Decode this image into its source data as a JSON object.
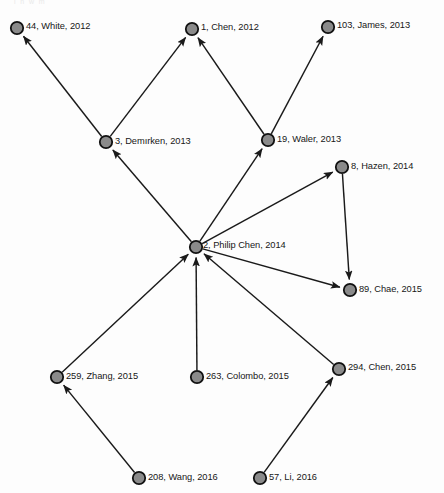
{
  "figure": {
    "type": "citation-network-graph",
    "top_artifact_text": "l  n  w  m",
    "node_fill": "#8a8a8a",
    "node_stroke": "#111111",
    "edge_color": "#1a1a1a",
    "background": "#fdfdfd"
  },
  "chart_data": {
    "type": "diagram",
    "title": "",
    "nodes": [
      {
        "id": "44",
        "label": "44, White, 2012",
        "author": "White",
        "year": 2012,
        "x": 17,
        "y": 28,
        "label_x": 26,
        "label_y": 27
      },
      {
        "id": "1",
        "label": "1, Chen, 2012",
        "author": "Chen",
        "year": 2012,
        "x": 192,
        "y": 29,
        "label_x": 201,
        "label_y": 28
      },
      {
        "id": "103",
        "label": "103, James, 2013",
        "author": "James",
        "year": 2013,
        "x": 328,
        "y": 27,
        "label_x": 337,
        "label_y": 26
      },
      {
        "id": "3",
        "label": "3, Demırken, 2013",
        "author": "Demırken",
        "year": 2013,
        "x": 106,
        "y": 142,
        "label_x": 115,
        "label_y": 142
      },
      {
        "id": "19",
        "label": "19, Waler, 2013",
        "author": "Waler",
        "year": 2013,
        "x": 268,
        "y": 140,
        "label_x": 277,
        "label_y": 140
      },
      {
        "id": "8",
        "label": "8, Hazen, 2014",
        "author": "Hazen",
        "year": 2014,
        "x": 342,
        "y": 167,
        "label_x": 351,
        "label_y": 167
      },
      {
        "id": "2",
        "label": "2, Philip Chen, 2014",
        "author": "Philip Chen",
        "year": 2014,
        "x": 196,
        "y": 247,
        "label_x": 203,
        "label_y": 246
      },
      {
        "id": "89",
        "label": "89, Chae, 2015",
        "author": "Chae",
        "year": 2015,
        "x": 350,
        "y": 290,
        "label_x": 359,
        "label_y": 290
      },
      {
        "id": "259",
        "label": "259, Zhang, 2015",
        "author": "Zhang",
        "year": 2015,
        "x": 57,
        "y": 377,
        "label_x": 66,
        "label_y": 377
      },
      {
        "id": "263",
        "label": "263, Colombo, 2015",
        "author": "Colombo",
        "year": 2015,
        "x": 197,
        "y": 377,
        "label_x": 206,
        "label_y": 377
      },
      {
        "id": "294",
        "label": "294, Chen, 2015",
        "author": "Chen",
        "year": 2015,
        "x": 339,
        "y": 369,
        "label_x": 348,
        "label_y": 368
      },
      {
        "id": "208",
        "label": "208, Wang, 2016",
        "author": "Wang",
        "year": 2016,
        "x": 139,
        "y": 478,
        "label_x": 148,
        "label_y": 478
      },
      {
        "id": "57",
        "label": "57, Li, 2016",
        "author": "Li",
        "year": 2016,
        "x": 260,
        "y": 478,
        "label_x": 269,
        "label_y": 478
      }
    ],
    "edges": [
      {
        "from": "3",
        "to": "44",
        "directed": true
      },
      {
        "from": "3",
        "to": "1",
        "directed": true
      },
      {
        "from": "19",
        "to": "1",
        "directed": true
      },
      {
        "from": "19",
        "to": "103",
        "directed": true
      },
      {
        "from": "2",
        "to": "3",
        "directed": true
      },
      {
        "from": "2",
        "to": "19",
        "directed": true
      },
      {
        "from": "2",
        "to": "8",
        "directed": true
      },
      {
        "from": "2",
        "to": "89",
        "directed": true
      },
      {
        "from": "8",
        "to": "89",
        "directed": true
      },
      {
        "from": "259",
        "to": "2",
        "directed": true
      },
      {
        "from": "263",
        "to": "2",
        "directed": true
      },
      {
        "from": "294",
        "to": "2",
        "directed": true
      },
      {
        "from": "208",
        "to": "259",
        "directed": true
      },
      {
        "from": "57",
        "to": "294",
        "directed": true
      }
    ]
  }
}
